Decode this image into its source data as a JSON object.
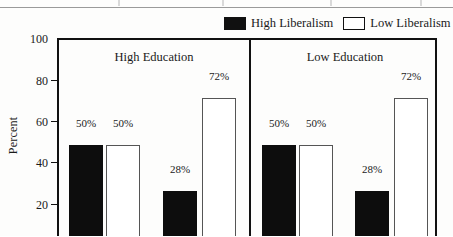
{
  "legend": {
    "items": [
      {
        "label": "High Liberalism",
        "swatch": "dark",
        "color": "#101010"
      },
      {
        "label": "Low Liberalism",
        "swatch": "light",
        "color": "#ffffff"
      }
    ]
  },
  "axis": {
    "y_title": "Percent",
    "y_ticks": [
      "100",
      "80",
      "60",
      "40",
      "20"
    ]
  },
  "panels": [
    {
      "title": "High Education"
    },
    {
      "title": "Low Education"
    }
  ],
  "chart_data": {
    "type": "bar",
    "title": "",
    "xlabel": "",
    "ylabel": "Percent",
    "ylim": [
      0,
      100
    ],
    "ytick_values": [
      20,
      40,
      60,
      80,
      100
    ],
    "grid": false,
    "legend_position": "top-right",
    "panels": [
      "High Education",
      "Low Education"
    ],
    "series": [
      {
        "name": "High Liberalism",
        "color": "#101010",
        "fill": "solid"
      },
      {
        "name": "Low Liberalism",
        "color": "#ffffff",
        "fill": "open"
      }
    ],
    "groups": [
      {
        "panel": "High Education",
        "bars": [
          {
            "series": "High Liberalism",
            "value": 50,
            "label": "50%"
          },
          {
            "series": "Low Liberalism",
            "value": 50,
            "label": "50%"
          },
          {
            "series": "High Liberalism",
            "value": 28,
            "label": "28%"
          },
          {
            "series": "Low Liberalism",
            "value": 72,
            "label": "72%"
          }
        ]
      },
      {
        "panel": "Low Education",
        "bars": [
          {
            "series": "High Liberalism",
            "value": 50,
            "label": "50%"
          },
          {
            "series": "Low Liberalism",
            "value": 50,
            "label": "50%"
          },
          {
            "series": "High Liberalism",
            "value": 28,
            "label": "28%"
          },
          {
            "series": "Low Liberalism",
            "value": 72,
            "label": "72%"
          }
        ]
      }
    ]
  },
  "bars": [
    {
      "label": "50%",
      "value": 50,
      "fill": "dark",
      "left": 10,
      "width": 34,
      "label_left": 8,
      "label_width": 38
    },
    {
      "label": "50%",
      "value": 50,
      "fill": "light",
      "left": 47,
      "width": 34,
      "label_left": 45,
      "label_width": 38
    },
    {
      "label": "28%",
      "value": 28,
      "fill": "dark",
      "left": 104,
      "width": 34,
      "label_left": 102,
      "label_width": 38
    },
    {
      "label": "72%",
      "value": 72,
      "fill": "light",
      "left": 143,
      "width": 34,
      "label_left": 141,
      "label_width": 38
    },
    {
      "label": "50%",
      "value": 50,
      "fill": "dark",
      "left": 203,
      "width": 34,
      "label_left": 201,
      "label_width": 38
    },
    {
      "label": "50%",
      "value": 50,
      "fill": "light",
      "left": 240,
      "width": 34,
      "label_left": 238,
      "label_width": 38
    },
    {
      "label": "28%",
      "value": 28,
      "fill": "dark",
      "left": 296,
      "width": 34,
      "label_left": 294,
      "label_width": 38
    },
    {
      "label": "72%",
      "value": 72,
      "fill": "light",
      "left": 335,
      "width": 34,
      "label_left": 333,
      "label_width": 38
    }
  ]
}
